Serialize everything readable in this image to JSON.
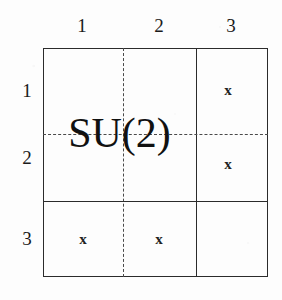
{
  "figure": {
    "kind": "matrix-block-structure",
    "block_label": "SU(2)",
    "column_headers": [
      "1",
      "2",
      "3"
    ],
    "row_headers": [
      "1",
      "2",
      "3"
    ],
    "marker_symbol": "x",
    "cells": [
      {
        "row": "1",
        "col": "3",
        "value": "x"
      },
      {
        "row": "2",
        "col": "3",
        "value": "x"
      },
      {
        "row": "3",
        "col": "1",
        "value": "x"
      },
      {
        "row": "3",
        "col": "2",
        "value": "x"
      }
    ],
    "colors": {
      "line": "#2b2b2b",
      "dashed_line": "#4a4a4a",
      "text": "#111111",
      "background": "#fdfdfd"
    }
  }
}
